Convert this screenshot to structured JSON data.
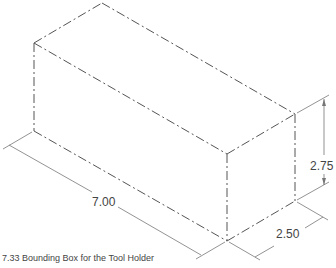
{
  "figure": {
    "caption": "7.33  Bounding Box for the Tool Holder",
    "dimensions": {
      "length": "7.00",
      "width": "2.50",
      "height": "2.75"
    },
    "line_style": "dash-dot (phantom)"
  }
}
